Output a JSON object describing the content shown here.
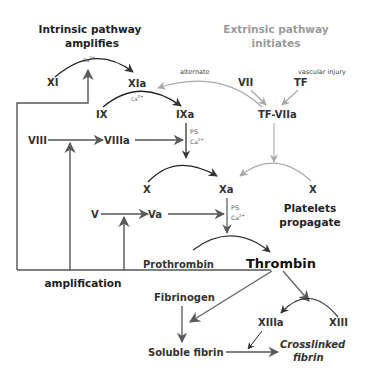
{
  "titles": {
    "intrinsic_line1": "Intrinsic pathway",
    "intrinsic_line2": "amplifies",
    "extrinsic_line1": "Extrinsic pathway",
    "extrinsic_line2": "initiates",
    "platelets_line1": "Platelets",
    "platelets_line2": "propagate",
    "amplification": "amplification"
  },
  "nodes": {
    "XI": "XI",
    "XIa": "XIa",
    "IX": "IX",
    "IXa": "IXa",
    "VII": "VII",
    "TF": "TF",
    "TF_VIIa": "TF-VIIa",
    "VIII": "VIII",
    "VIIIa": "VIIIa",
    "X_left": "X",
    "Xa": "Xa",
    "X_right": "X",
    "V": "V",
    "Va": "Va",
    "Prothrombin": "Prothrombin",
    "Thrombin": "Thrombin",
    "Fibrinogen": "Fibrinogen",
    "Soluble_fibrin": "Soluble fibrin",
    "XIIIa": "XIIIa",
    "XIII": "XIII",
    "Crosslinked_line1": "Crosslinked",
    "Crosslinked_line2": "fibrin"
  },
  "annotations": {
    "alternate": "alternate",
    "vascular_injury": "vascular injury",
    "ca_xi": "Ca",
    "ca_xi_sup": "2+",
    "ca_ix": "Ca",
    "ca_ix_sup": "2+",
    "ps_ixa": "PS",
    "ca_ixa": "Ca",
    "ca_ixa_sup": "2+",
    "ps_xa": "PS",
    "ca_xa": "Ca",
    "ca_xa_sup": "2+"
  },
  "colors": {
    "dark_arrow": "#333333",
    "gray_arrow": "#a8a8a8",
    "medium_arrow": "#666666",
    "text_dark": "#333333",
    "text_gray": "#9a9a9a"
  }
}
